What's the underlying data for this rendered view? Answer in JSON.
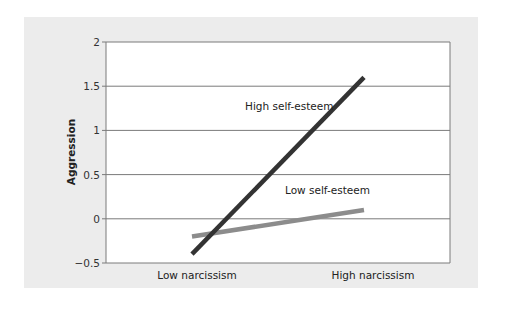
{
  "chart_data": {
    "type": "line",
    "title": "",
    "xlabel": "",
    "ylabel": "Aggression",
    "categories": [
      "Low narcissism",
      "High narcissism"
    ],
    "ylim": [
      -0.5,
      2
    ],
    "yticks": [
      -0.5,
      0,
      0.5,
      1,
      1.5,
      2
    ],
    "ytick_labels": [
      "−0.5",
      "0",
      "0.5",
      "1",
      "1.5",
      "2"
    ],
    "grid": true,
    "legend": "none (inline annotations)",
    "series": [
      {
        "name": "High self-esteem",
        "values": [
          -0.4,
          1.6
        ],
        "color": "#333333"
      },
      {
        "name": "Low self-esteem",
        "values": [
          -0.2,
          0.1
        ],
        "color": "#8c8c8c"
      }
    ],
    "annotations": [
      {
        "text": "High self-esteem",
        "series": 0
      },
      {
        "text": "Low self-esteem",
        "series": 1
      }
    ]
  },
  "colors": {
    "panel_background": "#ececec",
    "plot_background": "#ffffff",
    "gridline": "#7a7a7a",
    "high_self_esteem_line": "#333333",
    "low_self_esteem_line": "#8c8c8c"
  }
}
